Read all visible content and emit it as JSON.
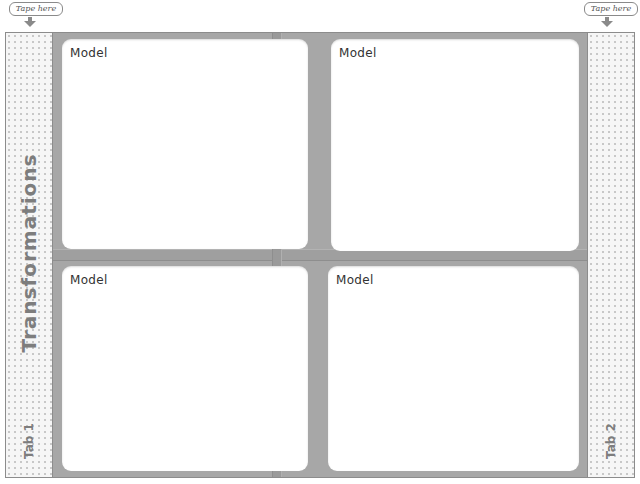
{
  "tapes": [
    {
      "label": "Tape here",
      "position": "left"
    },
    {
      "label": "Tape here",
      "position": "right"
    }
  ],
  "title": "Transformations",
  "tabs": [
    {
      "label": "Tab 1"
    },
    {
      "label": "Tab 2"
    }
  ],
  "cards": [
    {
      "label": "Model",
      "position": "top-left"
    },
    {
      "label": "Model",
      "position": "top-right"
    },
    {
      "label": "Model",
      "position": "bottom-left"
    },
    {
      "label": "Model",
      "position": "bottom-right"
    }
  ],
  "colors": {
    "frame_gray": "#a7a7a7",
    "tab_strip": "#f6f6f6",
    "label_gray": "#7d7d7d",
    "card": "#ffffff"
  }
}
